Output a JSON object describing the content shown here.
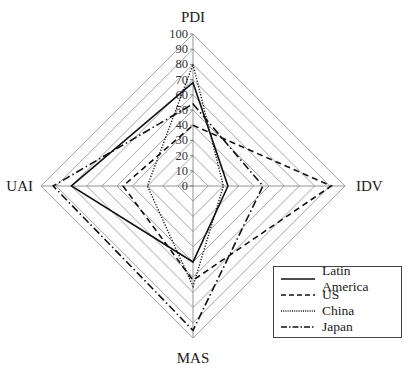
{
  "chart_data": {
    "type": "radar",
    "title": "",
    "axes": [
      "PDI",
      "IDV",
      "MAS",
      "UAI"
    ],
    "axis_positions": {
      "PDI": "top",
      "IDV": "right",
      "MAS": "bottom",
      "UAI": "left"
    },
    "range": [
      0,
      100
    ],
    "ticks": [
      0,
      10,
      20,
      30,
      40,
      50,
      60,
      70,
      80,
      90,
      100
    ],
    "grid": true,
    "legend_position": "bottom-right",
    "series": [
      {
        "name": "Latin America",
        "style": "solid",
        "values": {
          "PDI": 68,
          "IDV": 23,
          "MAS": 50,
          "UAI": 80
        }
      },
      {
        "name": "US",
        "style": "dashed",
        "values": {
          "PDI": 40,
          "IDV": 91,
          "MAS": 62,
          "UAI": 46
        }
      },
      {
        "name": "China",
        "style": "dotted",
        "values": {
          "PDI": 80,
          "IDV": 20,
          "MAS": 66,
          "UAI": 30
        }
      },
      {
        "name": "Japan",
        "style": "dash-dot",
        "values": {
          "PDI": 54,
          "IDV": 46,
          "MAS": 95,
          "UAI": 92
        }
      }
    ]
  },
  "labels": {
    "pdi": "PDI",
    "idv": "IDV",
    "mas": "MAS",
    "uai": "UAI"
  },
  "legend": [
    {
      "label": "Latin America",
      "style": "solid"
    },
    {
      "label": "US",
      "style": "dashed"
    },
    {
      "label": "China",
      "style": "dotted"
    },
    {
      "label": "Japan",
      "style": "dash-dot"
    }
  ]
}
